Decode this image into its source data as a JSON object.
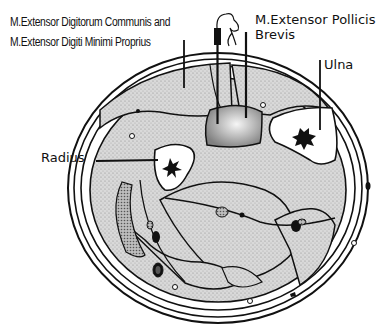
{
  "diagram": {
    "type": "anatomical cross-section",
    "labels": {
      "edc_emdp": {
        "lines": [
          "M.Extensor Digitorum Communis and",
          "M.Extensor Digiti Minimi Proprius"
        ]
      },
      "epb": {
        "lines": [
          "M.Extensor Pollicis",
          "Brevis"
        ]
      },
      "ulna": "Ulna",
      "radius": "Radius"
    },
    "colors": {
      "background": "#ffffff",
      "outline": "#111111",
      "muscle_fill": "#d6d6d6",
      "bone_fill": "#ffffff",
      "marrow": "#111111",
      "target_gradient_center": "#f4f4f4",
      "target_gradient_edge": "#8a8a8a"
    }
  }
}
